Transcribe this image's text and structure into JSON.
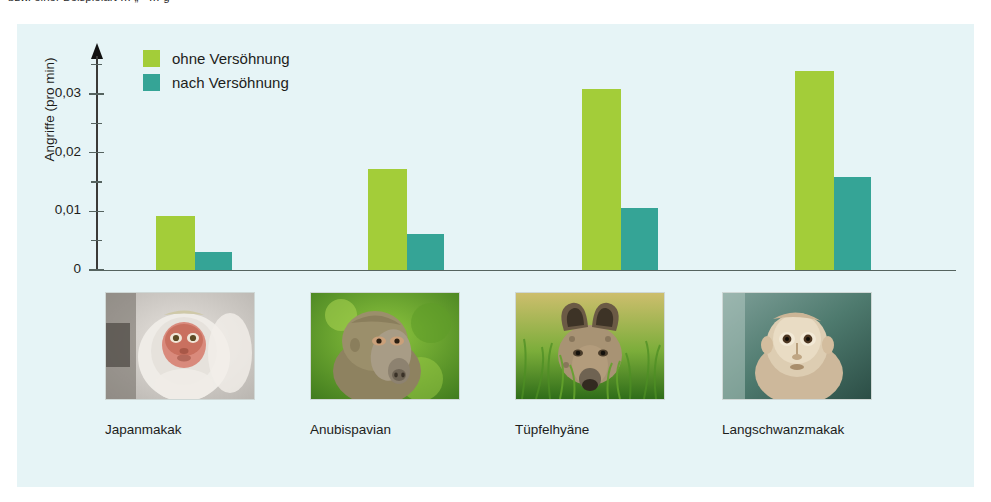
{
  "top_text_fragment": "bzw. einer Beispielart … „    “ … g",
  "figure": {
    "background_color": "#e6f4f6",
    "legend": [
      {
        "label": "ohne Versöhnung",
        "color": "#a3cd39",
        "key": "ohne"
      },
      {
        "label": "nach Versöhnung",
        "color": "#35a496",
        "key": "nach"
      }
    ]
  },
  "chart_data": {
    "type": "bar",
    "title": "",
    "xlabel": "",
    "ylabel": "Angriffe (pro min)",
    "ylim": [
      0,
      0.0365
    ],
    "yticks": [
      0,
      0.01,
      0.02,
      0.03
    ],
    "ytick_labels": [
      "0",
      "0,01",
      "0,02",
      "0,03"
    ],
    "yminor_ticks": [
      0.005,
      0.015,
      0.025,
      0.035
    ],
    "grid": false,
    "legend_position": "top-left",
    "categories": [
      "Japanmakak",
      "Anubispavian",
      "Tüpfelhyäne",
      "Langschwanzmakak"
    ],
    "series": [
      {
        "name": "ohne Versöhnung",
        "color": "#a3cd39",
        "values": [
          0.0092,
          0.0172,
          0.0308,
          0.0339
        ]
      },
      {
        "name": "nach Versöhnung",
        "color": "#35a496",
        "values": [
          0.003,
          0.0061,
          0.0106,
          0.0159
        ]
      }
    ]
  },
  "photos": [
    {
      "caption": "Japanmakak",
      "subject": "japanese-macaque-photo"
    },
    {
      "caption": "Anubispavian",
      "subject": "olive-baboon-photo"
    },
    {
      "caption": "Tüpfelhyäne",
      "subject": "spotted-hyena-photo"
    },
    {
      "caption": "Langschwanzmakak",
      "subject": "long-tailed-macaque-photo"
    }
  ]
}
